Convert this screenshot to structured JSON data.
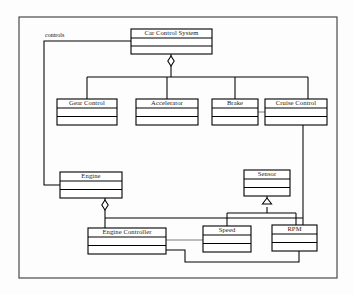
{
  "diagram": {
    "kind": "uml-class-diagram",
    "frame": {
      "x": 19,
      "y": 17,
      "width": 318,
      "height": 261
    },
    "colors": {
      "background": "#fdfdfd",
      "box_fill": "#ffffff",
      "stroke": "#000000",
      "frame_stroke": "#4a4a4a",
      "thin_stroke": "#5a5a5a",
      "text": "#1a1a1a"
    },
    "classes": [
      {
        "id": "car_control_system",
        "name": "Car Control System",
        "x": 131,
        "y": 29,
        "width": 81,
        "height": 25,
        "header_height": 9
      },
      {
        "id": "gear_control",
        "name": "Gear Control",
        "x": 57,
        "y": 99,
        "width": 60,
        "height": 26,
        "header_height": 9
      },
      {
        "id": "accelerator",
        "name": "Accelerator",
        "x": 136,
        "y": 99,
        "width": 62,
        "height": 26,
        "header_height": 9
      },
      {
        "id": "brake",
        "name": "Brake",
        "x": 212,
        "y": 99,
        "width": 46,
        "height": 26,
        "header_height": 9
      },
      {
        "id": "cruise_control",
        "name": "Cruise Control",
        "x": 265,
        "y": 99,
        "width": 62,
        "height": 26,
        "header_height": 9
      },
      {
        "id": "engine",
        "name": "Engine",
        "x": 60,
        "y": 172,
        "width": 62,
        "height": 26,
        "header_height": 9
      },
      {
        "id": "sensor",
        "name": "Sensor",
        "x": 244,
        "y": 170,
        "width": 46,
        "height": 26,
        "header_height": 9
      },
      {
        "id": "engine_controller",
        "name": "Engine Controller",
        "x": 88,
        "y": 228,
        "width": 78,
        "height": 26,
        "header_height": 9
      },
      {
        "id": "speed",
        "name": "Speed",
        "x": 203,
        "y": 226,
        "width": 48,
        "height": 26,
        "header_height": 9
      },
      {
        "id": "rpm",
        "name": "RPM",
        "x": 272,
        "y": 225,
        "width": 45,
        "height": 26,
        "header_height": 9
      }
    ],
    "labels": [
      {
        "id": "controls",
        "text": "controls",
        "x": 45,
        "y": 36
      }
    ],
    "relationships": [
      {
        "id": "ccs-aggregation-trunk",
        "type": "aggregation",
        "from": "car_control_system",
        "marker": "hollow-diamond",
        "marker_x": 171,
        "marker_y": 61,
        "path": "M171,54 L171,57 M171,66 L171,77 M87,77 L308,77 M87,77 L87,99 M167,77 L167,99 M235,77 L235,99 M308,77 L308,99"
      },
      {
        "id": "brake-cruise-link",
        "type": "association",
        "from": "brake",
        "to": "cruise_control",
        "thin": true,
        "path": "M258,112 L265,112"
      },
      {
        "id": "ccs-controls-engine",
        "type": "association",
        "from": "car_control_system",
        "to": "engine",
        "label": "controls",
        "path": "M131,41 L44,41 L44,185 L60,185"
      },
      {
        "id": "engine-aggregation",
        "type": "aggregation",
        "from": "engine",
        "marker": "hollow-diamond",
        "marker_x": 105,
        "marker_y": 205,
        "path": "M105,198 L105,201 M105,210 L105,218 M105,218 L303,218 M105,218 L105,228"
      },
      {
        "id": "sensor-generalization",
        "type": "generalization",
        "to": "sensor",
        "marker": "hollow-triangle",
        "marker_x": 267,
        "marker_y": 201,
        "path": "M267,196 L267,201 M267,207 L267,213 M227,213 L296,213 M227,213 L227,226 M296,213 L296,225"
      },
      {
        "id": "cruise-rpm",
        "type": "association",
        "from": "cruise_control",
        "to": "rpm",
        "path": "M303,125 L303,225"
      },
      {
        "id": "engine-controller-speed",
        "type": "association",
        "from": "engine_controller",
        "to": "speed",
        "thin": true,
        "path": "M166,240 L203,240"
      },
      {
        "id": "engine-controller-rpm",
        "type": "association",
        "from": "engine_controller",
        "to": "rpm",
        "path": "M166,250 L185,250 L185,262 L299,262 L299,251"
      }
    ]
  }
}
